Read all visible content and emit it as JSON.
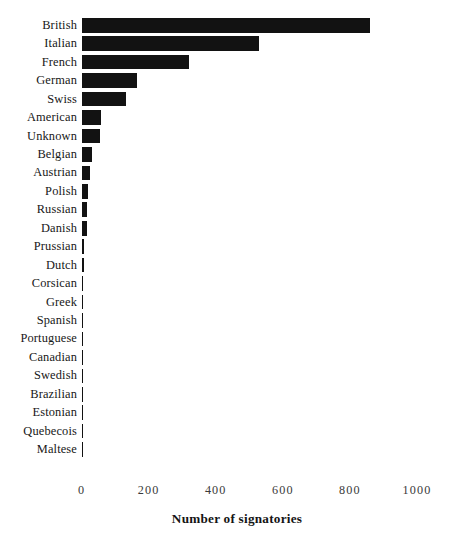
{
  "chart_data": {
    "type": "bar",
    "orientation": "horizontal",
    "title": "",
    "xlabel": "Number of signatories",
    "ylabel": "",
    "xlim": [
      0,
      1000
    ],
    "xticks": [
      0,
      200,
      400,
      600,
      800,
      1000
    ],
    "xtick_labels": [
      "0",
      "200",
      "400",
      "600",
      "800",
      "1000"
    ],
    "grid": false,
    "legend": false,
    "bar_color": "#121212",
    "categories": [
      "British",
      "Italian",
      "French",
      "German",
      "Swiss",
      "American",
      "Unknown",
      "Belgian",
      "Austrian",
      "Polish",
      "Russian",
      "Danish",
      "Prussian",
      "Dutch",
      "Corsican",
      "Greek",
      "Spanish",
      "Portuguese",
      "Canadian",
      "Swedish",
      "Brazilian",
      "Estonian",
      "Quebecois",
      "Maltese"
    ],
    "values": [
      860,
      530,
      320,
      165,
      133,
      58,
      55,
      32,
      25,
      18,
      17,
      15,
      8,
      7,
      4,
      3,
      3,
      3,
      2,
      2,
      2,
      2,
      2,
      2
    ]
  }
}
